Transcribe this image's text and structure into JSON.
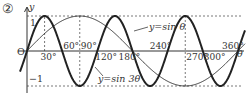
{
  "problem_label": "②",
  "chart_data": {
    "type": "line",
    "title": "",
    "xlabel": "θ",
    "ylabel": "y",
    "origin_label": "O",
    "xlim": [
      0,
      360
    ],
    "ylim": [
      -1,
      1
    ],
    "grid": false,
    "x_ticks": [
      {
        "value": 30,
        "label": "30°",
        "position": "below"
      },
      {
        "value": 60,
        "label": "60°",
        "position": "above"
      },
      {
        "value": 90,
        "label": "90°",
        "position": "above"
      },
      {
        "value": 120,
        "label": "120°",
        "position": "below"
      },
      {
        "value": 180,
        "label": "180°",
        "position": "below"
      },
      {
        "value": 240,
        "label": "240°",
        "position": "above"
      },
      {
        "value": 270,
        "label": "270°",
        "position": "below"
      },
      {
        "value": 300,
        "label": "300°",
        "position": "below"
      },
      {
        "value": 360,
        "label": "360°",
        "position": "above"
      }
    ],
    "y_ticks": [
      {
        "value": 1,
        "label": "1"
      },
      {
        "value": -1,
        "label": "−1"
      }
    ],
    "reference_lines": [
      {
        "type": "horizontal",
        "y": 1,
        "style": "dashed"
      },
      {
        "type": "horizontal",
        "y": -1,
        "style": "dashed"
      },
      {
        "type": "vertical",
        "x": 30,
        "style": "dashed",
        "from": 0,
        "to": 1
      },
      {
        "type": "vertical",
        "x": 90,
        "style": "dashed",
        "from": -1,
        "to": 1
      },
      {
        "type": "vertical",
        "x": 270,
        "style": "dashed",
        "from": -1,
        "to": 1
      }
    ],
    "series": [
      {
        "name": "y=sinθ",
        "label": "y=sin θ",
        "expression": "sin(θ)",
        "line_weight": "thin",
        "x": [
          0,
          30,
          60,
          90,
          120,
          150,
          180,
          210,
          240,
          270,
          300,
          330,
          360
        ],
        "values": [
          0,
          0.5,
          0.866,
          1,
          0.866,
          0.5,
          0,
          -0.5,
          -0.866,
          -1,
          -0.866,
          -0.5,
          0
        ]
      },
      {
        "name": "y=sin3θ",
        "label": "y=sin 3θ",
        "expression": "sin(3θ)",
        "line_weight": "thick",
        "x": [
          0,
          30,
          60,
          90,
          120,
          150,
          180,
          210,
          240,
          270,
          300,
          330,
          360
        ],
        "values": [
          0,
          1,
          0,
          -1,
          0,
          1,
          0,
          -1,
          0,
          1,
          0,
          -1,
          0
        ]
      }
    ]
  },
  "colors": {
    "curve": "#222222",
    "axis": "#333333",
    "dashed": "#555555",
    "background": "#ffffff"
  }
}
